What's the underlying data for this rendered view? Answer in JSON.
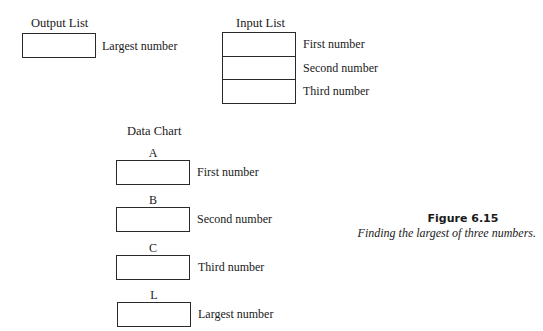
{
  "output_list": {
    "title": "Output List",
    "cells": [
      {
        "label": "Largest number"
      }
    ]
  },
  "input_list": {
    "title": "Input List",
    "cells": [
      {
        "label": "First number"
      },
      {
        "label": "Second number"
      },
      {
        "label": "Third number"
      }
    ]
  },
  "data_chart": {
    "title": "Data Chart",
    "variables": [
      {
        "name": "A",
        "label": "First number"
      },
      {
        "name": "B",
        "label": "Second number"
      },
      {
        "name": "C",
        "label": "Third number"
      },
      {
        "name": "L",
        "label": "Largest number"
      }
    ]
  },
  "figure": {
    "number": "Figure 6.15",
    "caption": "Finding the largest of three numbers."
  }
}
